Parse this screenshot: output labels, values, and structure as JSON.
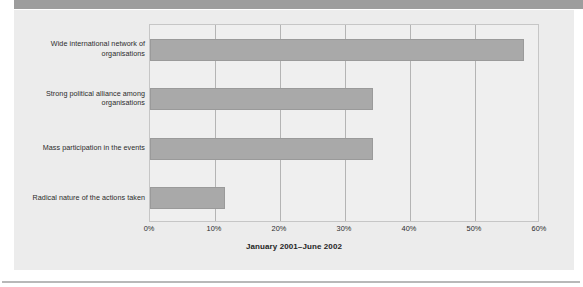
{
  "figure": {
    "background_color": "#ffffff",
    "panel_color": "#ececec",
    "top_band_color": "#9d9d9d",
    "rule_color": "#b8b8b8"
  },
  "caption": "January 2001–June 2002",
  "chart_data": {
    "type": "bar",
    "orientation": "horizontal",
    "title": "",
    "subtitle": "",
    "xlabel": "",
    "ylabel": "",
    "categories": [
      "Wide international network of organisations",
      "Strong political alliance among organisations",
      "Mass participation in the events",
      "Radical nature of the actions taken"
    ],
    "category_lines": [
      [
        "Wide international network of",
        "organisations"
      ],
      [
        "Strong political alliance among",
        "organisations"
      ],
      [
        "Mass participation in the events"
      ],
      [
        "Radical nature of the actions taken"
      ]
    ],
    "values": [
      57.5,
      34.3,
      34.3,
      11.5
    ],
    "value_labels": [
      "57.5%",
      "34.3%",
      "34.3%",
      "11.5%"
    ],
    "xlim": [
      0,
      60
    ],
    "xticks": [
      0,
      10,
      20,
      30,
      40,
      50,
      60
    ],
    "xticklabels": [
      "0%",
      "10%",
      "20%",
      "30%",
      "40%",
      "50%",
      "60%"
    ],
    "grid": "vertical",
    "legend": "none",
    "bar_color": "#a9a9a9",
    "bar_edge_color": "#9a9a9a",
    "plot_background": "#efefef",
    "gridline_color": "#b4b4b4",
    "annotations": [
      "January – June 2002 survey period"
    ]
  }
}
